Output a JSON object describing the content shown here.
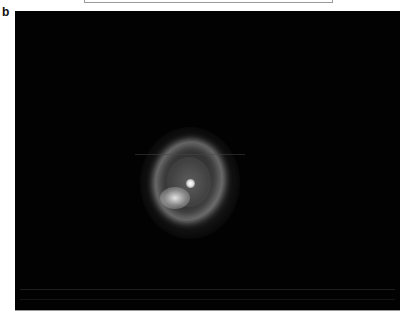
{
  "figure": {
    "panel_label": "b",
    "image": {
      "subject": "planetary nebula (ring with bright central star)",
      "background_color": "#020202",
      "nebula_center_px": [
        176,
        173
      ]
    }
  }
}
